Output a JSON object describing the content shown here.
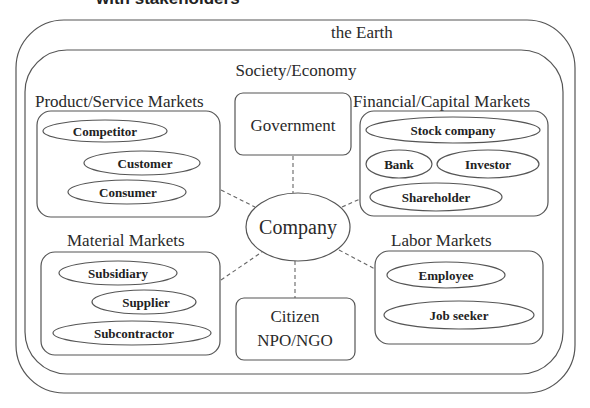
{
  "caption_partial": "with stakeholders",
  "outer": {
    "label": "the Earth"
  },
  "society": {
    "label": "Society/Economy"
  },
  "center": {
    "label": "Company"
  },
  "government": {
    "label": "Government"
  },
  "citizen": {
    "line1": "Citizen",
    "line2": "NPO/NGO"
  },
  "product_markets": {
    "label": "Product/Service Markets",
    "items": [
      "Competitor",
      "Customer",
      "Consumer"
    ]
  },
  "financial_markets": {
    "label": "Financial/Capital Markets",
    "items": [
      "Stock company",
      "Bank",
      "Investor",
      "Shareholder"
    ]
  },
  "material_markets": {
    "label": "Material Markets",
    "items": [
      "Subsidiary",
      "Supplier",
      "Subcontractor"
    ]
  },
  "labor_markets": {
    "label": "Labor Markets",
    "items": [
      "Employee",
      "Job seeker"
    ]
  }
}
